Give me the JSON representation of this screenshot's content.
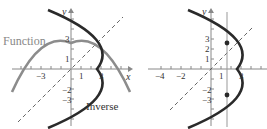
{
  "diagram": {
    "left_panel": {
      "labels": {
        "function": "Function",
        "inverse": "Inverse",
        "x_axis": "x",
        "y_axis": "y"
      },
      "x_ticks": [
        {
          "value": -3,
          "label": "−3"
        },
        {
          "value": 1,
          "label": "1"
        },
        {
          "value": 3,
          "label": "3"
        }
      ],
      "y_ticks": [
        {
          "value": 3,
          "label": "3"
        },
        {
          "value": 1,
          "label": "1"
        },
        {
          "value": -2,
          "label": "−2"
        },
        {
          "value": -3,
          "label": "−3"
        }
      ],
      "colors": {
        "function": "#8c8c8c",
        "inverse": "#2a2a2a",
        "axes": "#888888",
        "line_y_eq_x": "#555555"
      }
    },
    "right_panel": {
      "labels": {
        "y_axis": "y"
      },
      "x_ticks": [
        {
          "value": -4,
          "label": "−4"
        },
        {
          "value": -2,
          "label": "−2"
        },
        {
          "value": 1,
          "label": "1"
        },
        {
          "value": 3,
          "label": "3"
        }
      ],
      "y_ticks": [
        {
          "value": 3,
          "label": "3"
        },
        {
          "value": 2,
          "label": "2"
        },
        {
          "value": 1,
          "label": "1"
        },
        {
          "value": -2,
          "label": "−2"
        },
        {
          "value": -3,
          "label": "−3"
        }
      ],
      "vertical_line_x": 1.5,
      "colors": {
        "curve": "#2a2a2a",
        "axes": "#888888",
        "vertical_line": "#999999",
        "points": "#2a2a2a"
      }
    }
  }
}
